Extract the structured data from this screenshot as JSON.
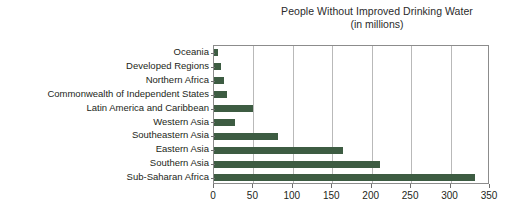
{
  "chart_data": {
    "type": "bar",
    "orientation": "horizontal",
    "title": "People Without Improved Drinking Water",
    "subtitle": "(in millions)",
    "xlabel": "",
    "ylabel": "",
    "xlim": [
      0,
      350
    ],
    "xticks": [
      0,
      50,
      100,
      150,
      200,
      250,
      300,
      350
    ],
    "xtick_labels": [
      "0",
      "50",
      "100",
      "150",
      "200",
      "250",
      "300",
      "350"
    ],
    "grid": "vertical",
    "legend": "none",
    "bar_color": "#3d5c42",
    "frame_color": "#8c8c8c",
    "gridline_color": "#b9b9b9",
    "categories": [
      "Oceania",
      "Developed Regions",
      "Northern Africa",
      "Commonwealth of Independent States",
      "Latin America and Caribbean",
      "Western Asia",
      "Southeastern Asia",
      "Eastern Asia",
      "Southern Asia",
      "Sub-Saharan Africa"
    ],
    "values": [
      5,
      9,
      13,
      17,
      50,
      26,
      81,
      164,
      210,
      331
    ]
  }
}
